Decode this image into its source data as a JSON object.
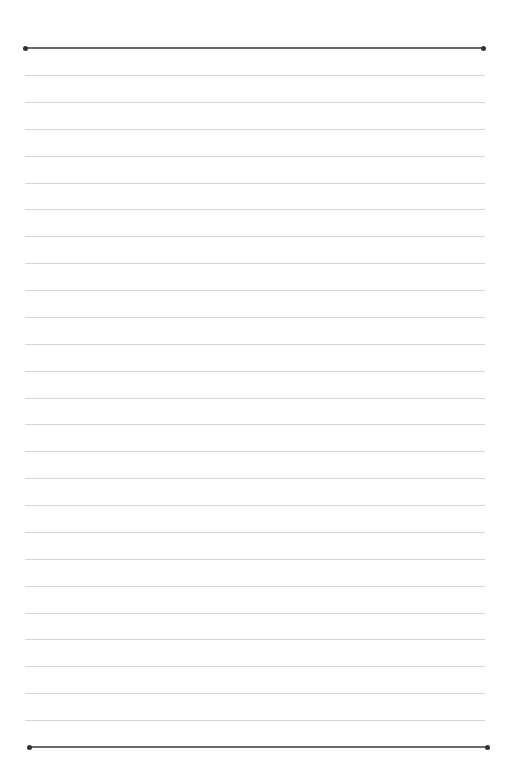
{
  "page": {
    "type": "lined-paper",
    "top_rule": {
      "y": 48,
      "x1": 25,
      "x2": 483,
      "color": "#6a6a6a"
    },
    "bottom_rule": {
      "y": 747,
      "x1": 29,
      "x2": 487,
      "color": "#6a6a6a"
    },
    "thin_lines": {
      "count": 25,
      "first_y": 75,
      "spacing": 26.88,
      "x1": 25,
      "x2": 485,
      "color": "#d6d6d6"
    },
    "endpoint_color": "#333333"
  }
}
